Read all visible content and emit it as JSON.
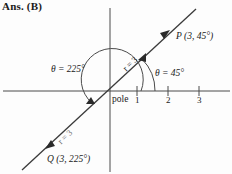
{
  "answer": {
    "text": "Ans. (B)"
  },
  "figure": {
    "type": "polar-coordinate-diagram",
    "pole_label": "pole",
    "axis_ticks": [
      {
        "label": "1",
        "value": 1
      },
      {
        "label": "2",
        "value": 2
      },
      {
        "label": "3",
        "value": 3
      }
    ],
    "points": [
      {
        "name": "P",
        "label": "P (3, 45°)",
        "r": 3,
        "theta": "45°"
      },
      {
        "name": "Q",
        "label": "Q (3, 225°)",
        "r": 3,
        "theta": "225°"
      }
    ],
    "angle_labels": [
      {
        "name": "theta-225",
        "text": "θ = 225°"
      },
      {
        "name": "theta-45",
        "text": "θ = 45°"
      }
    ],
    "radius_labels": [
      {
        "name": "r-upper",
        "text": "r = 3"
      },
      {
        "name": "r-lower",
        "text": "r = 3"
      }
    ],
    "colors": {
      "stroke": "#3a3a3a",
      "text": "#1a1a1a",
      "background": "#fdfdfd"
    }
  }
}
